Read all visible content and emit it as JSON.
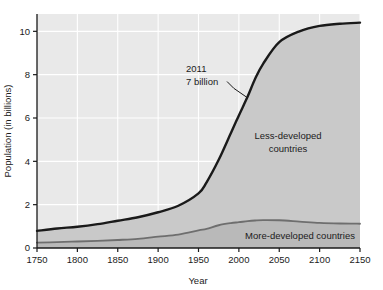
{
  "chart_data": {
    "type": "area",
    "title": "",
    "xlabel": "Year",
    "ylabel": "Population (in billions)",
    "xlim": [
      1750,
      2150
    ],
    "ylim": [
      0,
      10.8
    ],
    "xticks": [
      1750,
      1800,
      1850,
      1900,
      1950,
      2000,
      2050,
      2100,
      2150
    ],
    "xtick_labels": [
      "1750",
      "1800",
      "1850",
      "1900",
      "1950",
      "2000",
      "2050",
      "2100",
      "2150"
    ],
    "yticks": [
      0,
      2,
      4,
      6,
      8,
      10
    ],
    "ytick_labels": [
      "0",
      "2",
      "4",
      "6",
      "8",
      "10"
    ],
    "grid": true,
    "legend_position": "inline-annotations",
    "x": [
      1750,
      1775,
      1800,
      1825,
      1850,
      1875,
      1900,
      1925,
      1950,
      1960,
      1975,
      1990,
      2000,
      2011,
      2020,
      2030,
      2050,
      2075,
      2100,
      2125,
      2150
    ],
    "series": [
      {
        "name": "Total population (world)",
        "label": "2011 7 billion",
        "values": [
          0.79,
          0.9,
          0.98,
          1.1,
          1.26,
          1.42,
          1.65,
          1.95,
          2.52,
          3.03,
          4.07,
          5.3,
          6.12,
          7.0,
          7.8,
          8.5,
          9.5,
          10.0,
          10.25,
          10.35,
          10.4
        ],
        "color": "#1a1a1a",
        "line_width": 2.4
      },
      {
        "name": "More-developed countries",
        "label": "More-developed countries",
        "values": [
          0.25,
          0.27,
          0.3,
          0.33,
          0.37,
          0.42,
          0.52,
          0.62,
          0.81,
          0.88,
          1.05,
          1.15,
          1.19,
          1.24,
          1.27,
          1.29,
          1.28,
          1.22,
          1.16,
          1.13,
          1.12
        ],
        "color": "#6e6e6e",
        "line_width": 1.8
      }
    ],
    "annotations": [
      {
        "name": "milestone-2011",
        "line1": "2011",
        "line2": "7 billion",
        "x": 2011,
        "y": 7.0,
        "text_x": 1955,
        "text_y": 8.1
      },
      {
        "name": "less-developed-label",
        "line1": "Less-developed",
        "line2": "countries",
        "x": 2060,
        "y": 4.8
      },
      {
        "name": "more-developed-label",
        "line1": "More-developed countries",
        "x": 2075,
        "y": 0.95
      }
    ],
    "colors": {
      "plot_background": "#e9e9e9",
      "less_developed_fill": "#c9c9c9",
      "more_developed_fill": "#b9b9b9",
      "gridline": "#ffffff",
      "axis": "#1a1a1a",
      "page_background": "#ffffff"
    }
  }
}
